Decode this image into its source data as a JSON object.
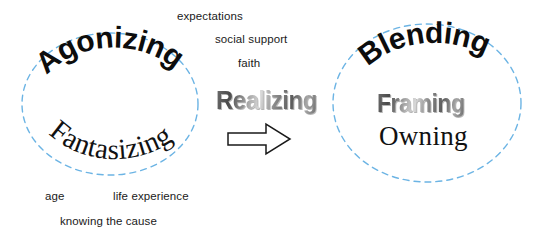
{
  "canvas": {
    "width": 539,
    "height": 241,
    "background": "#ffffff"
  },
  "colors": {
    "circle_stroke": "#6cb4e4",
    "text_black": "#0d0d0d",
    "text_gray": "#8d8d8d",
    "arrow_stroke": "#1a1a1a",
    "arrow_fill": "#ffffff"
  },
  "diagram": {
    "type": "concept-map",
    "left_cluster": {
      "shape": "dashed-circle",
      "words": [
        {
          "text": "Agonizing",
          "style": "bold-arch-up"
        },
        {
          "text": "Fantasizing",
          "style": "serif-arch-down"
        }
      ]
    },
    "center": {
      "words": [
        {
          "text": "Realizing",
          "style": "gray-emboss"
        }
      ],
      "arrow": {
        "label": "right-arrow",
        "direction": "right"
      }
    },
    "right_cluster": {
      "shape": "dashed-circle",
      "words": [
        {
          "text": "Blending",
          "style": "bold-arch-up"
        },
        {
          "text": "Framing",
          "style": "gray-emboss"
        },
        {
          "text": "Owning",
          "style": "serif"
        }
      ]
    },
    "top_labels": [
      {
        "text": "expectations"
      },
      {
        "text": "social support"
      },
      {
        "text": "faith"
      }
    ],
    "bottom_labels": [
      {
        "text": "age"
      },
      {
        "text": "life experience"
      },
      {
        "text": "knowing the cause"
      }
    ]
  }
}
